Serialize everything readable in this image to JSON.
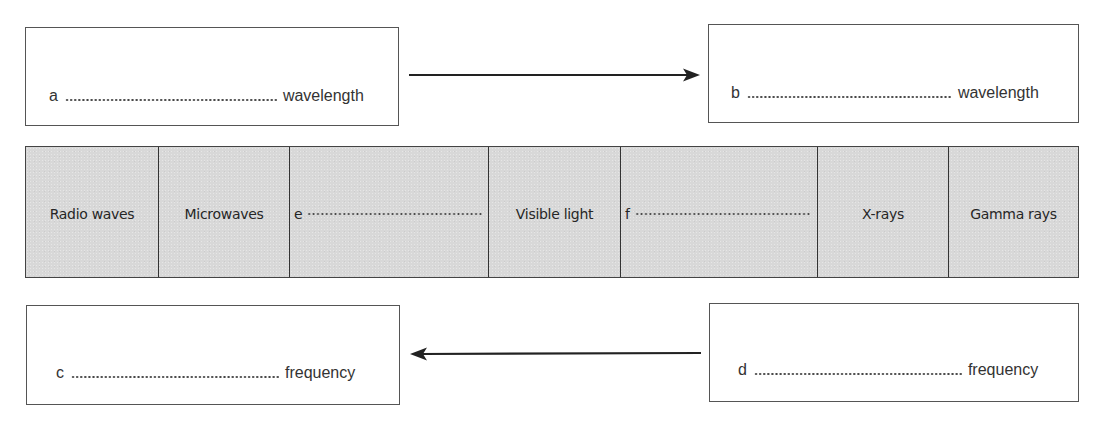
{
  "diagram": {
    "top_row": {
      "left_box": {
        "letter": "a",
        "label": "wavelength"
      },
      "arrow_direction": "right",
      "right_box": {
        "letter": "b",
        "label": "wavelength"
      }
    },
    "spectrum": {
      "bands": [
        {
          "label": "Radio waves",
          "blank": false
        },
        {
          "label": "Microwaves",
          "blank": false
        },
        {
          "label": "e",
          "blank": true
        },
        {
          "label": "Visible light",
          "blank": false
        },
        {
          "label": "f",
          "blank": true
        },
        {
          "label": "X-rays",
          "blank": false
        },
        {
          "label": "Gamma rays",
          "blank": false
        }
      ],
      "fill_color": "#d8d8d8",
      "border_color": "#444444"
    },
    "bottom_row": {
      "left_box": {
        "letter": "c",
        "label": "frequency"
      },
      "arrow_direction": "left",
      "right_box": {
        "letter": "d",
        "label": "frequency"
      }
    }
  }
}
